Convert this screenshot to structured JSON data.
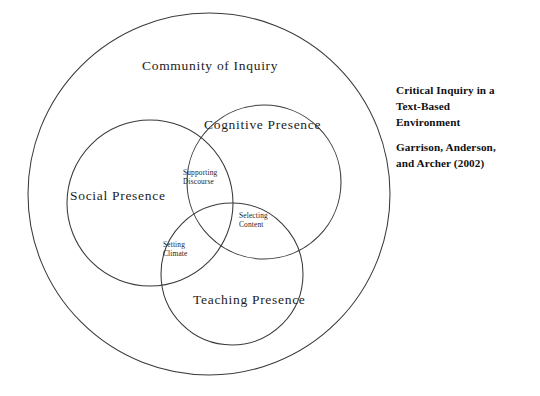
{
  "diagram": {
    "type": "venn",
    "title_visible": false,
    "background_color": "#ffffff",
    "stroke_color": "#3a3a3a",
    "text_color": "#1d1d1d",
    "outer": {
      "label": "Community of Inquiry",
      "cx": 209,
      "cy": 194,
      "r": 181
    },
    "circles": [
      {
        "name": "social",
        "label": "Social  Presence",
        "cx": 150,
        "cy": 203,
        "r": 83
      },
      {
        "name": "cognitive",
        "label": "Cognitive Presence",
        "cx": 264,
        "cy": 182,
        "r": 77
      },
      {
        "name": "teaching",
        "label": "Teaching  Presence",
        "cx": 232,
        "cy": 274,
        "r": 71
      }
    ],
    "intersections": [
      {
        "name": "supporting-discourse",
        "line1": "Supporting",
        "line2": "Discourse",
        "between": [
          "social",
          "cognitive"
        ]
      },
      {
        "name": "selecting-content",
        "line1": "Selecting",
        "line2": "Content",
        "between": [
          "cognitive",
          "teaching"
        ]
      },
      {
        "name": "setting-climate",
        "line1": "Setting",
        "line2": "Climate",
        "between": [
          "social",
          "teaching"
        ]
      }
    ]
  },
  "caption": {
    "title_line1": "Critical Inquiry in a",
    "title_line2": "Text-Based",
    "title_line3": "Environment",
    "authors_line1": "Garrison, Anderson,",
    "authors_line2": "and Archer (2002)"
  }
}
